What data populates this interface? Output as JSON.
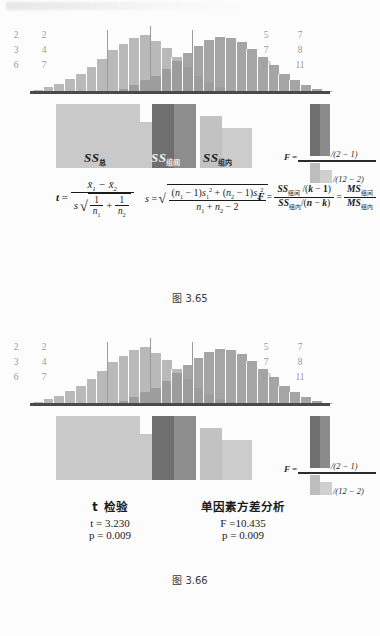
{
  "page": {
    "kind": "scanned-textbook-page",
    "top_bleed_text": ""
  },
  "figures": [
    {
      "id": "fig-3-65",
      "caption": "图 3.65",
      "left_numbers": [
        [
          "2",
          "3",
          "6"
        ],
        [
          "2",
          "4",
          "7"
        ]
      ],
      "right_numbers": [
        [
          "5",
          "7",
          "10"
        ],
        [
          "7",
          "8",
          "11"
        ]
      ],
      "ss_blocks": [
        {
          "name": "ss-total",
          "symbol": "SS",
          "subscript": "总"
        },
        {
          "name": "ss-between",
          "symbol": "SS",
          "subscript": "组间"
        },
        {
          "name": "ss-within",
          "symbol": "SS",
          "subscript": "组内"
        }
      ],
      "f_ratio": {
        "label": "F =",
        "numerator_suffix": "/(2 − 1)",
        "denominator_suffix": "/(12 − 2)"
      },
      "formulas": {
        "t_lhs": "t",
        "t_numerator": "x̄₁ − x̄₂",
        "t_denominator": "s √(1/n₁ + 1/n₂)",
        "s_lhs": "s",
        "s_body": "√( ((n₁−1)s₁² + (n₂−1)s₂²) / (n₁+n₂−2) )",
        "F_lhs": "F",
        "F_first": "SS组间/(k − 1) ÷ SS组内/(n − k)",
        "F_second": "MS组间 / MS组内"
      }
    },
    {
      "id": "fig-3-66",
      "caption": "图 3.66",
      "left_numbers": [
        [
          "2",
          "3",
          "6"
        ],
        [
          "2",
          "4",
          "7"
        ]
      ],
      "right_numbers": [
        [
          "5",
          "7",
          "10"
        ],
        [
          "7",
          "8",
          "11"
        ]
      ],
      "ss_blocks": [
        {
          "name": "ss-total",
          "symbol": "SS",
          "subscript": "总"
        },
        {
          "name": "ss-between",
          "symbol": "SS",
          "subscript": "组间"
        },
        {
          "name": "ss-within",
          "symbol": "SS",
          "subscript": "组内"
        }
      ],
      "f_ratio": {
        "label": "F =",
        "numerator_suffix": "/(2 − 1)",
        "denominator_suffix": "/(12 − 2)"
      },
      "results": {
        "left_title": "t 检验",
        "left_stat": "t = 3.230",
        "left_p": "p = 0.009",
        "right_title": "单因素方差分析",
        "right_stat": "F =10.435",
        "right_p": "p =  0.009"
      }
    }
  ],
  "symbols": {
    "SS": "SS",
    "MS": "MS",
    "sub_total": "总",
    "sub_between": "组间",
    "sub_within": "组内",
    "t": "t",
    "s": "s",
    "F": "F",
    "k_minus_1": "(k − 1)",
    "n_minus_k": "(n − k)",
    "two_minus_one": "(2 − 1)",
    "twelve_minus_two": "(12 − 2)"
  },
  "chart_data": {
    "type": "bar",
    "title": "",
    "xlabel": "",
    "ylabel": "",
    "grid": false,
    "legend": "none",
    "categories": [
      "1",
      "2",
      "3",
      "4",
      "5",
      "6",
      "7",
      "8",
      "9",
      "10",
      "11",
      "12",
      "13",
      "14",
      "15",
      "16",
      "17",
      "18",
      "19",
      "20",
      "21",
      "22",
      "23",
      "24",
      "25",
      "26",
      "27",
      "28"
    ],
    "series": [
      {
        "name": "group-1",
        "color": "#b9b9b9",
        "values": [
          2,
          4,
          7,
          11,
          16,
          22,
          29,
          36,
          42,
          47,
          49,
          44,
          38,
          30,
          22,
          14,
          8,
          4,
          2,
          0,
          0,
          0,
          0,
          0,
          0,
          0,
          0,
          0
        ]
      },
      {
        "name": "group-2",
        "color": "#9a9a9a",
        "values": [
          0,
          0,
          0,
          0,
          0,
          0,
          0,
          0,
          3,
          6,
          10,
          14,
          20,
          27,
          34,
          40,
          45,
          48,
          47,
          43,
          37,
          30,
          23,
          16,
          10,
          6,
          3,
          1
        ]
      }
    ],
    "reference_lines": [
      {
        "name": "mean-group-1",
        "x_index": 10
      },
      {
        "name": "grand-mean",
        "x_index": 14
      },
      {
        "name": "mean-group-2",
        "x_index": 18
      }
    ],
    "ylim": [
      0,
      52
    ]
  }
}
